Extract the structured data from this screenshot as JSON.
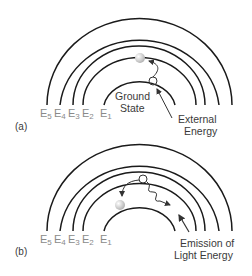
{
  "panels": [
    {
      "id": "a",
      "label": "(a)",
      "levels": [
        "E5",
        "E4",
        "E3",
        "E2",
        "E1"
      ],
      "level_subscripts": [
        "5",
        "4",
        "3",
        "2",
        "1"
      ],
      "annotation_center_1": "Ground",
      "annotation_center_2": "State",
      "annotation_right_1": "External",
      "annotation_right_2": "Energy"
    },
    {
      "id": "b",
      "label": "(b)",
      "levels": [
        "E5",
        "E4",
        "E3",
        "E2",
        "E1"
      ],
      "level_subscripts": [
        "5",
        "4",
        "3",
        "2",
        "1"
      ],
      "annotation_right_1": "Emission of",
      "annotation_right_2": "Light Energy"
    }
  ],
  "colors": {
    "arc": "#1a1a1a",
    "level_label": "#8a8a8a",
    "text": "#3a3a3a",
    "electron": "#d8d8d8"
  }
}
